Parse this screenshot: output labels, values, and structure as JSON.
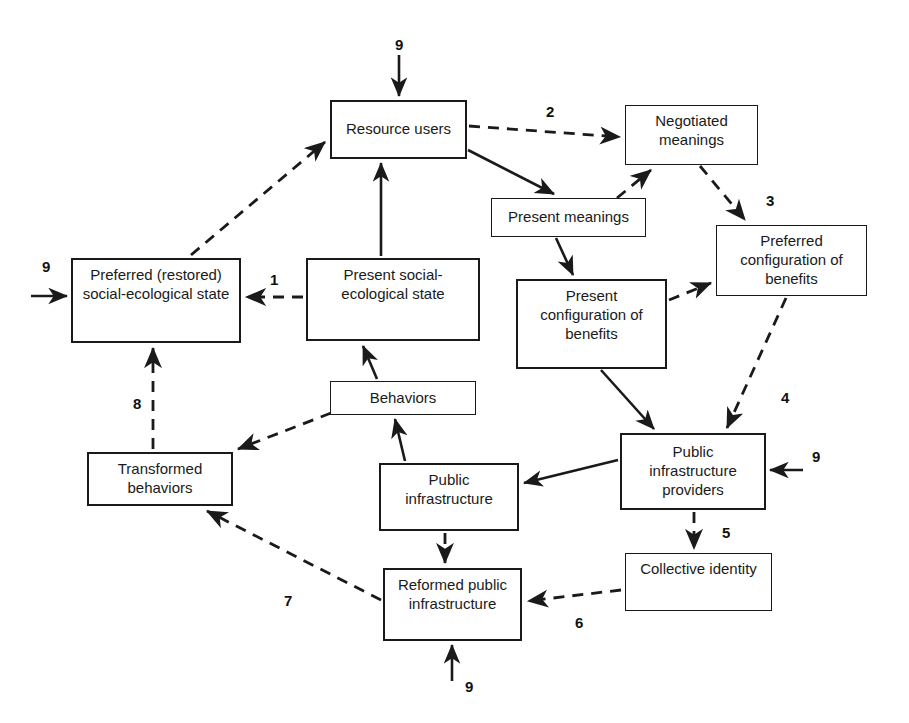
{
  "diagram": {
    "background_color": "#ffffff",
    "stroke_color": "#1a1a1a",
    "nodes": [
      {
        "id": "resource_users",
        "label": "Resource users",
        "x": 330,
        "y": 100,
        "w": 137,
        "h": 59
      },
      {
        "id": "negotiated_meanings",
        "label": "Negotiated\nmeanings",
        "x": 625,
        "y": 105,
        "w": 133,
        "h": 60
      },
      {
        "id": "present_meanings",
        "label": "Present meanings",
        "x": 491,
        "y": 198,
        "w": 155,
        "h": 39
      },
      {
        "id": "preferred_config_benefits",
        "label": "Preferred\nconfiguration of\nbenefits",
        "x": 716,
        "y": 225,
        "w": 151,
        "h": 71
      },
      {
        "id": "preferred_state",
        "label": "Preferred (restored)\nsocial-ecological state",
        "x": 71,
        "y": 258,
        "w": 170,
        "h": 85
      },
      {
        "id": "present_state",
        "label": "Present social-\necological state",
        "x": 306,
        "y": 258,
        "w": 174,
        "h": 83
      },
      {
        "id": "present_config_benefits",
        "label": "Present\nconfiguration of\nbenefits",
        "x": 516,
        "y": 279,
        "w": 151,
        "h": 90
      },
      {
        "id": "behaviors",
        "label": "Behaviors",
        "x": 330,
        "y": 381,
        "w": 146,
        "h": 34
      },
      {
        "id": "public_infrastructure_providers",
        "label": "Public\ninfrastructure\nproviders",
        "x": 620,
        "y": 433,
        "w": 146,
        "h": 77
      },
      {
        "id": "transformed_behaviors",
        "label": "Transformed\nbehaviors",
        "x": 87,
        "y": 452,
        "w": 146,
        "h": 54
      },
      {
        "id": "public_infrastructure",
        "label": "Public\ninfrastructure",
        "x": 379,
        "y": 463,
        "w": 140,
        "h": 68
      },
      {
        "id": "collective_identity",
        "label": "Collective identity",
        "x": 625,
        "y": 553,
        "w": 147,
        "h": 58
      },
      {
        "id": "reformed_public_infrastructure",
        "label": "Reformed public\ninfrastructure",
        "x": 383,
        "y": 568,
        "w": 139,
        "h": 73
      }
    ],
    "edge_labels": [
      {
        "id": "label-9-resource-users",
        "text": "9",
        "x": 395,
        "y": 36
      },
      {
        "id": "label-2",
        "text": "2",
        "x": 546,
        "y": 103
      },
      {
        "id": "label-3",
        "text": "3",
        "x": 766,
        "y": 192
      },
      {
        "id": "label-9-preferred-state",
        "text": "9",
        "x": 42,
        "y": 258
      },
      {
        "id": "label-1",
        "text": "1",
        "x": 270,
        "y": 271
      },
      {
        "id": "label-4",
        "text": "4",
        "x": 781,
        "y": 389
      },
      {
        "id": "label-8",
        "text": "8",
        "x": 133,
        "y": 395
      },
      {
        "id": "label-9-providers",
        "text": "9",
        "x": 812,
        "y": 448
      },
      {
        "id": "label-5",
        "text": "5",
        "x": 722,
        "y": 524
      },
      {
        "id": "label-7",
        "text": "7",
        "x": 284,
        "y": 592
      },
      {
        "id": "label-6",
        "text": "6",
        "x": 575,
        "y": 614
      },
      {
        "id": "label-9-reformed",
        "text": "9",
        "x": 465,
        "y": 678
      }
    ],
    "edges": [
      {
        "id": "edge-9-into-resource-users",
        "from": "external",
        "to": "resource_users",
        "style": "solid",
        "label": "9"
      },
      {
        "id": "edge-resource-users-to-negotiated-meanings",
        "from": "resource_users",
        "to": "negotiated_meanings",
        "style": "dashed",
        "label": "2"
      },
      {
        "id": "edge-resource-users-to-present-meanings",
        "from": "resource_users",
        "to": "present_meanings",
        "style": "solid",
        "label": ""
      },
      {
        "id": "edge-present-meanings-to-negotiated-meanings",
        "from": "present_meanings",
        "to": "negotiated_meanings",
        "style": "dashed",
        "label": ""
      },
      {
        "id": "edge-negotiated-meanings-to-preferred-config",
        "from": "negotiated_meanings",
        "to": "preferred_config_benefits",
        "style": "dashed",
        "label": "3"
      },
      {
        "id": "edge-present-meanings-to-present-config",
        "from": "present_meanings",
        "to": "present_config_benefits",
        "style": "solid",
        "label": ""
      },
      {
        "id": "edge-present-config-to-preferred-config",
        "from": "present_config_benefits",
        "to": "preferred_config_benefits",
        "style": "dashed",
        "label": ""
      },
      {
        "id": "edge-preferred-config-to-providers",
        "from": "preferred_config_benefits",
        "to": "public_infrastructure_providers",
        "style": "dashed",
        "label": "4"
      },
      {
        "id": "edge-present-config-to-providers",
        "from": "present_config_benefits",
        "to": "public_infrastructure_providers",
        "style": "solid",
        "label": ""
      },
      {
        "id": "edge-present-state-to-preferred-state",
        "from": "present_state",
        "to": "preferred_state",
        "style": "dashed",
        "label": "1"
      },
      {
        "id": "edge-9-into-preferred-state",
        "from": "external",
        "to": "preferred_state",
        "style": "solid",
        "label": "9"
      },
      {
        "id": "edge-preferred-state-to-resource-users",
        "from": "preferred_state",
        "to": "resource_users",
        "style": "dashed",
        "label": ""
      },
      {
        "id": "edge-present-state-to-resource-users",
        "from": "present_state",
        "to": "resource_users",
        "style": "solid",
        "label": ""
      },
      {
        "id": "edge-behaviors-to-present-state",
        "from": "behaviors",
        "to": "present_state",
        "style": "solid",
        "label": ""
      },
      {
        "id": "edge-behaviors-to-transformed-behaviors",
        "from": "behaviors",
        "to": "transformed_behaviors",
        "style": "dashed",
        "label": ""
      },
      {
        "id": "edge-transformed-behaviors-to-preferred-state",
        "from": "transformed_behaviors",
        "to": "preferred_state",
        "style": "dashed",
        "label": "8"
      },
      {
        "id": "edge-public-infrastructure-to-behaviors",
        "from": "public_infrastructure",
        "to": "behaviors",
        "style": "solid",
        "label": ""
      },
      {
        "id": "edge-providers-to-public-infrastructure",
        "from": "public_infrastructure_providers",
        "to": "public_infrastructure",
        "style": "solid",
        "label": ""
      },
      {
        "id": "edge-9-into-providers",
        "from": "external",
        "to": "public_infrastructure_providers",
        "style": "solid",
        "label": "9"
      },
      {
        "id": "edge-providers-to-collective-identity",
        "from": "public_infrastructure_providers",
        "to": "collective_identity",
        "style": "dashed",
        "label": "5"
      },
      {
        "id": "edge-collective-identity-to-reformed",
        "from": "collective_identity",
        "to": "reformed_public_infrastructure",
        "style": "dashed",
        "label": "6"
      },
      {
        "id": "edge-public-infrastructure-to-reformed",
        "from": "public_infrastructure",
        "to": "reformed_public_infrastructure",
        "style": "dashed",
        "label": ""
      },
      {
        "id": "edge-reformed-to-transformed-behaviors",
        "from": "reformed_public_infrastructure",
        "to": "transformed_behaviors",
        "style": "dashed",
        "label": "7"
      },
      {
        "id": "edge-9-into-reformed",
        "from": "external",
        "to": "reformed_public_infrastructure",
        "style": "solid",
        "label": "9"
      }
    ]
  }
}
